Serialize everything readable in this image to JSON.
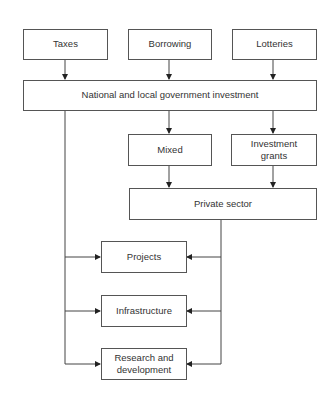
{
  "diagram": {
    "type": "flowchart",
    "nodes": {
      "taxes": {
        "label": "Taxes"
      },
      "borrowing": {
        "label": "Borrowing"
      },
      "lotteries": {
        "label": "Lotteries"
      },
      "government": {
        "label": "National and local government investment"
      },
      "mixed": {
        "label": "Mixed"
      },
      "investment_grants": {
        "label": "Investment grants"
      },
      "private_sector": {
        "label": "Private sector"
      },
      "projects": {
        "label": "Projects"
      },
      "infrastructure": {
        "label": "Infrastructure"
      },
      "research": {
        "label": "Research and development"
      }
    },
    "edges": [
      [
        "Taxes",
        "National and local government investment"
      ],
      [
        "Borrowing",
        "National and local government investment"
      ],
      [
        "Lotteries",
        "National and local government investment"
      ],
      [
        "National and local government investment",
        "Mixed"
      ],
      [
        "National and local government investment",
        "Investment grants"
      ],
      [
        "Mixed",
        "Private sector"
      ],
      [
        "Investment grants",
        "Private sector"
      ],
      [
        "National and local government investment",
        "Projects"
      ],
      [
        "National and local government investment",
        "Infrastructure"
      ],
      [
        "National and local government investment",
        "Research and development"
      ],
      [
        "Private sector",
        "Projects"
      ],
      [
        "Private sector",
        "Infrastructure"
      ],
      [
        "Private sector",
        "Research and development"
      ]
    ]
  }
}
